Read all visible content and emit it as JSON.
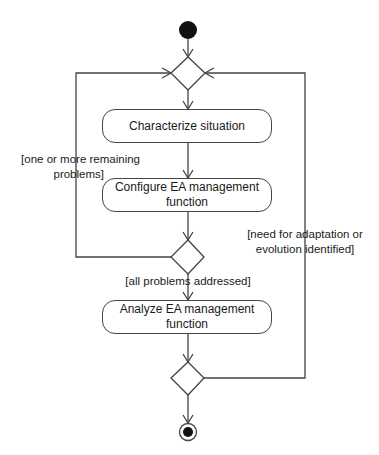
{
  "diagram": {
    "type": "UML activity diagram",
    "nodes": {
      "start": {
        "kind": "initial-node"
      },
      "merge_top": {
        "kind": "merge-node"
      },
      "action1": {
        "kind": "action",
        "label": "Characterize situation"
      },
      "action2": {
        "kind": "action",
        "label_line1": "Configure EA management",
        "label_line2": "function"
      },
      "decision1": {
        "kind": "decision-node"
      },
      "action3": {
        "kind": "action",
        "label_line1": "Analyze EA management",
        "label_line2": "function"
      },
      "decision2": {
        "kind": "decision-node"
      },
      "end": {
        "kind": "final-node"
      }
    },
    "guards": {
      "loop_left_line1": "[one or more remaining",
      "loop_left_line2": "problems]",
      "proceed": "[all problems addressed]",
      "loop_right_line1": "[need for adaptation or",
      "loop_right_line2": "evolution identified]"
    },
    "edges": [
      {
        "from": "start",
        "to": "merge_top"
      },
      {
        "from": "merge_top",
        "to": "action1"
      },
      {
        "from": "action1",
        "to": "action2"
      },
      {
        "from": "action2",
        "to": "decision1"
      },
      {
        "from": "decision1",
        "to": "merge_top",
        "guard": "[one or more remaining problems]"
      },
      {
        "from": "decision1",
        "to": "action3",
        "guard": "[all problems addressed]"
      },
      {
        "from": "action3",
        "to": "decision2"
      },
      {
        "from": "decision2",
        "to": "merge_top",
        "guard": "[need for adaptation or evolution identified]"
      },
      {
        "from": "decision2",
        "to": "end"
      }
    ],
    "colors": {
      "stroke": "#444444",
      "fill": "#ffffff",
      "node_fill": "#111111"
    }
  }
}
